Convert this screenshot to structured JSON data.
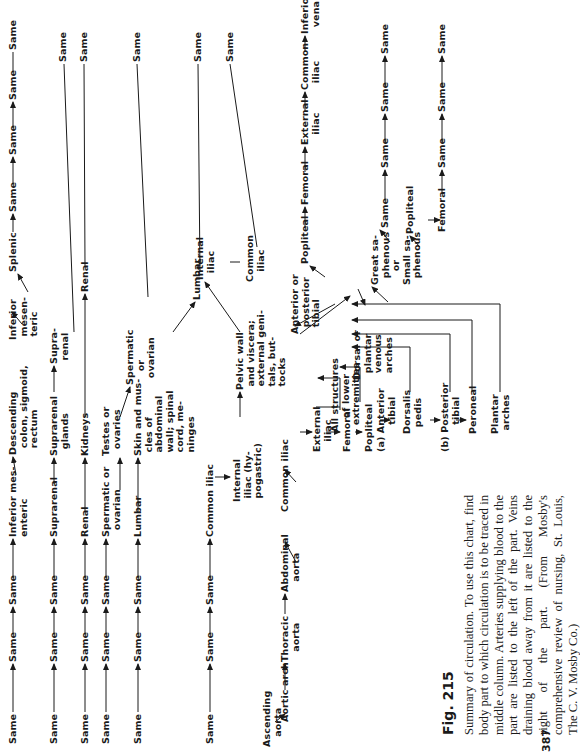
{
  "figure": {
    "label": "Fig. 215",
    "caption": "Summary of circulation. To use this chart, find body part to which circulation is to be traced in middle column. Arteries supplying blood to the part are listed to the left of the part. Veins draining blood away from it are listed to the right of the part. (From Mosby's comprehensive review of nursing, St. Louis, The C. V. Mosby Co.)",
    "page_number": "387"
  },
  "chart": {
    "main_trunk": [
      "Ascending aorta",
      "Aortic arch",
      "Thoracic aorta",
      "Abdominal aorta",
      "Common iliac"
    ],
    "rows": [
      {
        "arteries": [
          "Same",
          "Same",
          "Same",
          "Inferior mesenteric"
        ],
        "part": "Descending colon, sigmoid, rectum",
        "veins": [
          "Inferior mesenteric",
          "Splenic",
          "Same",
          "Same",
          "Same",
          "Same"
        ]
      },
      {
        "arteries": [
          "Same",
          "Same",
          "Same",
          "Suprarenal"
        ],
        "part": "Suprarenal glands",
        "veins": [
          "Suprarenal",
          "Same"
        ]
      },
      {
        "arteries": [
          "Same",
          "Same",
          "Same",
          "Renal"
        ],
        "part": "Kidneys",
        "veins": [
          "Renal",
          "Same"
        ]
      },
      {
        "arteries": [
          "Same",
          "Same",
          "Same",
          "Spermatic or ovarian"
        ],
        "part": "Testes or ovaries",
        "veins": [
          "Spermatic or ovarian",
          "Same"
        ]
      },
      {
        "arteries": [
          "Same",
          "Same",
          "Same",
          "Lumbar"
        ],
        "part": "Skin and muscles of abdominal wall; spinal cord, meninges",
        "veins": [
          "Lumbar",
          "Same"
        ]
      },
      {
        "arteries": [
          "Same",
          "Same",
          "Same",
          "Common iliac",
          "Internal iliac (hypogastric)"
        ],
        "part": "Pelvic wall and viscera; external genitals, buttocks",
        "veins": [
          "Internal iliac",
          "Common iliac",
          "Same"
        ]
      }
    ],
    "lower_limb": {
      "arteries": [
        "External iliac",
        "Femoral",
        "Popliteal"
      ],
      "branch_a": [
        "(a) Anterior tibial",
        "Dorsalis pedis"
      ],
      "branch_b": [
        "(b) Posterior tibial",
        "Peroneal",
        "Plantar arches"
      ],
      "part": "All structures of lower extremities",
      "deep_veins": [
        "Anterior or posterior tibial",
        "Popliteal",
        "Femoral",
        "External iliac",
        "Common iliac",
        "Inferior vena cava"
      ],
      "superficial_veins": {
        "origin": "Dorsal or plantar venous arches",
        "great": "Great saphenous",
        "or": "or",
        "small": "Small saphenous",
        "great_path": [
          "Same",
          "Same",
          "Same",
          "Same"
        ],
        "small_path": [
          "Popliteal",
          "Femoral",
          "Same",
          "Same",
          "Same"
        ]
      }
    }
  },
  "labels": {
    "same": "Same",
    "inf_mes_a": "Inferior mes-\nenteric",
    "desc_colon": "Descending\n  colon, sigmoid,\n  rectum",
    "inf_mes_v": "Inferior\n mesen-\n teric",
    "splenic": "Splenic",
    "suprarenal_a": "Suprarenal",
    "suprarenal_part": "Suprarenal\n  glands",
    "suprarenal_v": "Supra-\n renal",
    "renal_a": "Renal",
    "kidneys": "Kidneys",
    "renal_v": "Renal",
    "sperm_a": "Spermatic or\n  ovarian",
    "testes": "Testes or\n  ovaries",
    "sperm_v": "Spermatic\n    or\n  ovarian",
    "lumbar_a": "Lumbar",
    "skin": "Skin and mus-\n cles of\n abdominal\n wall; spinal\n cord, me-\n ninges",
    "lumbar_v": "Lumbar",
    "common_iliac_a": "Common iliac",
    "internal_iliac_a": "Internal\n iliac (hy-\n pogastric)",
    "pelvic": "Pelvic wall\n and viscera;\n external geni-\n tals, but-\n tocks",
    "internal_iliac_v": "Internal\n  iliac",
    "common_iliac_v": "Common\n   iliac",
    "ascending": "Ascending\n   aorta",
    "aortic_arch": "Aortic arch",
    "thoracic": "Thoracic\n   aorta",
    "abdominal": "Abdominal\n   aorta",
    "common_iliac_main": "Common iliac",
    "external_iliac": "External\n   iliac",
    "femoral": "Femoral",
    "all_structures": "All structures\n    of lower\n  extremities",
    "popliteal": "Popliteal",
    "ant_tibial": "(a) Anterior\n        tibial",
    "dorsalis": "Dorsalis\n  pedis",
    "post_tibial": "(b) Posterior\n        tibial",
    "peroneal": "Peroneal",
    "plantar": "Plantar\n arches",
    "dorsal_venous": "Dorsal or\n  plantar\n  venous\n  arches",
    "ant_post_tibial_v": "Anterior or\n  posterior\n  tibial",
    "popliteal_v": "Popliteal",
    "femoral_v": "Femoral",
    "external_iliac_v": "External\n   iliac",
    "common_iliac_v2": "Common\n  iliac",
    "ivc": "Inferior\n  vena cava",
    "great_saph": "Great sa-\n  phenous\n    or\nSmall sa-\n  phenous",
    "popliteal_sv": "Popliteal",
    "femoral_sv": "Femoral"
  }
}
